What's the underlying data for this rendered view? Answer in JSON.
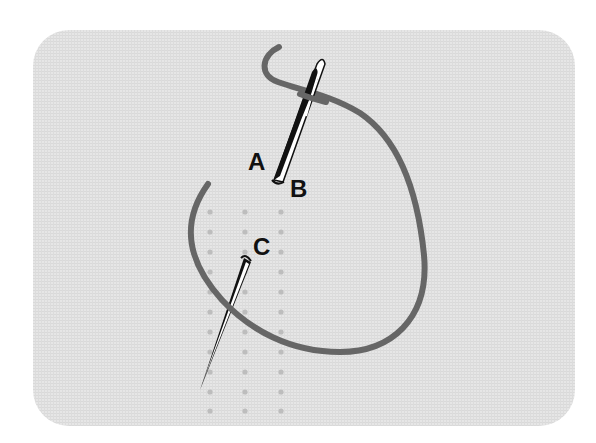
{
  "diagram": {
    "colors": {
      "fabric": "#e4e4e4",
      "fabric_weave": "#d6d6d6",
      "thread": "#666666",
      "dot": "#bdbdbd",
      "needle_outline": "#111111",
      "needle_body": "#ffffff",
      "label": "#111111"
    },
    "labels": [
      {
        "id": "A",
        "text": "A",
        "x": 248,
        "y": 150
      },
      {
        "id": "B",
        "text": "B",
        "x": 290,
        "y": 177
      },
      {
        "id": "C",
        "text": "C",
        "x": 253,
        "y": 235
      }
    ],
    "dot_grid": {
      "columns_x": [
        210,
        245,
        281
      ],
      "rows_y": [
        212,
        232,
        252,
        272,
        292,
        312,
        332,
        352,
        372,
        392,
        411
      ]
    },
    "needles": [
      {
        "id": "upper-needle",
        "description": "threaded needle with eye at top, point at B",
        "eye_top": [
          323,
          60
        ],
        "point": [
          277,
          182
        ]
      },
      {
        "id": "lower-needle",
        "description": "needle emerging at C, point at bottom-left",
        "top": [
          248,
          257
        ],
        "point": [
          201,
          390
        ]
      }
    ]
  }
}
